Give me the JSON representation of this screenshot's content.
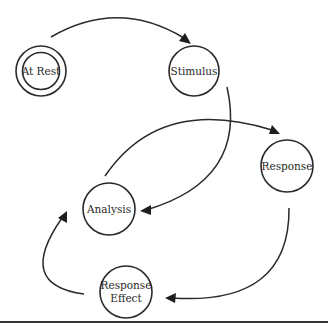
{
  "diagram": {
    "type": "state-cycle",
    "nodes": [
      {
        "id": "at_rest",
        "label": "At Rest",
        "double_border": true
      },
      {
        "id": "stimulus",
        "label": "Stimulus"
      },
      {
        "id": "response",
        "label": "Response"
      },
      {
        "id": "analysis",
        "label": "Analysis"
      },
      {
        "id": "response_effect",
        "label_line1": "Response",
        "label_line2": "Effect"
      }
    ],
    "edges": [
      {
        "from": "At Rest",
        "to": "Stimulus"
      },
      {
        "from": "Stimulus",
        "to": "Analysis"
      },
      {
        "from": "Analysis",
        "to": "Response"
      },
      {
        "from": "Response",
        "to": "Response Effect"
      },
      {
        "from": "Response Effect",
        "to": "Analysis"
      }
    ],
    "colors": {
      "stroke": "#2a2a2a",
      "background": "#ffffff"
    }
  }
}
